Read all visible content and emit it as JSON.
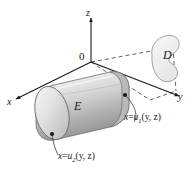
{
  "figure": {
    "type": "3d-solid-region-diagram",
    "background_color": "#ffffff",
    "line_color": "#1a1a1a",
    "solid_fill_light": "#f2f2f2",
    "solid_fill_mid": "#c9c9c9",
    "solid_fill_dark": "#9a9a9a",
    "projection_fill": "#efefef"
  },
  "axes": {
    "z_label": "z",
    "x_label": "x",
    "y_label": "y",
    "origin_label": "0"
  },
  "labels": {
    "solid_region": "E",
    "projection_region": "D",
    "front_surface": {
      "var": "x",
      "equals": "=",
      "func": "u",
      "sub": "1",
      "args": "(y, z)",
      "full": "x = u₁(y, z)"
    },
    "back_surface": {
      "var": "x",
      "equals": "=",
      "func": "u",
      "sub": "2",
      "args": "(y, z)",
      "full": "x = u₂(y, z)"
    }
  }
}
